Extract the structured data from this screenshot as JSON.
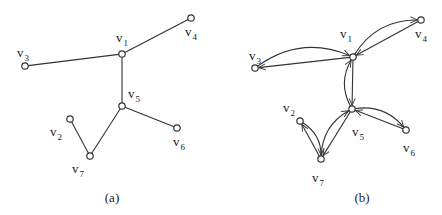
{
  "figure": {
    "panels": [
      {
        "id": "a",
        "caption": "(a)",
        "caption_pos": [
          112,
          202
        ],
        "type": "undirected-tree",
        "nodes": [
          {
            "id": "v1",
            "label": "v",
            "sub": "1",
            "pos": [
              122,
              54
            ],
            "label_pos": [
              116,
              42
            ]
          },
          {
            "id": "v2",
            "label": "v",
            "sub": "2",
            "pos": [
              70,
              119
            ],
            "label_pos": [
              50,
              136
            ]
          },
          {
            "id": "v3",
            "label": "v",
            "sub": "3",
            "pos": [
              25,
              66
            ],
            "label_pos": [
              17,
              57
            ]
          },
          {
            "id": "v4",
            "label": "v",
            "sub": "4",
            "pos": [
              191,
              18
            ],
            "label_pos": [
              185,
              36
            ]
          },
          {
            "id": "v5",
            "label": "v",
            "sub": "5",
            "pos": [
              122,
              106
            ],
            "label_pos": [
              128,
              98
            ]
          },
          {
            "id": "v6",
            "label": "v",
            "sub": "6",
            "pos": [
              177,
              128
            ],
            "label_pos": [
              173,
              146
            ]
          },
          {
            "id": "v7",
            "label": "v",
            "sub": "7",
            "pos": [
              90,
              156
            ],
            "label_pos": [
              72,
              173
            ]
          }
        ],
        "edges": [
          [
            "v3",
            "v1"
          ],
          [
            "v1",
            "v4"
          ],
          [
            "v1",
            "v5"
          ],
          [
            "v5",
            "v6"
          ],
          [
            "v5",
            "v7"
          ],
          [
            "v7",
            "v2"
          ]
        ]
      },
      {
        "id": "b",
        "caption": "(b)",
        "caption_pos": [
          362,
          202
        ],
        "type": "directed-symmetric",
        "nodes": [
          {
            "id": "v1",
            "label": "v",
            "sub": "1",
            "pos": [
              353,
              57
            ],
            "label_pos": [
              340,
              38
            ]
          },
          {
            "id": "v2",
            "label": "v",
            "sub": "2",
            "pos": [
              300,
              121
            ],
            "label_pos": [
              283,
              112
            ]
          },
          {
            "id": "v3",
            "label": "v",
            "sub": "3",
            "pos": [
              255,
              68
            ],
            "label_pos": [
              249,
              60
            ]
          },
          {
            "id": "v4",
            "label": "v",
            "sub": "4",
            "pos": [
              421,
              20
            ],
            "label_pos": [
              415,
              38
            ]
          },
          {
            "id": "v5",
            "label": "v",
            "sub": "5",
            "pos": [
              352,
              109
            ],
            "label_pos": [
              352,
              136
            ]
          },
          {
            "id": "v6",
            "label": "v",
            "sub": "6",
            "pos": [
              406,
              130
            ],
            "label_pos": [
              403,
              152
            ]
          },
          {
            "id": "v7",
            "label": "v",
            "sub": "7",
            "pos": [
              321,
              159
            ],
            "label_pos": [
              312,
              182
            ]
          }
        ],
        "arcs": [
          {
            "from": "v1",
            "to": "v3",
            "shape": "straight"
          },
          {
            "from": "v3",
            "to": "v1",
            "shape": "curved"
          },
          {
            "from": "v4",
            "to": "v1",
            "shape": "straight"
          },
          {
            "from": "v1",
            "to": "v4",
            "shape": "curved"
          },
          {
            "from": "v1",
            "to": "v5",
            "shape": "straight"
          },
          {
            "from": "v5",
            "to": "v1",
            "shape": "curved"
          },
          {
            "from": "v6",
            "to": "v5",
            "shape": "straight"
          },
          {
            "from": "v5",
            "to": "v6",
            "shape": "curved"
          },
          {
            "from": "v5",
            "to": "v7",
            "shape": "straight"
          },
          {
            "from": "v7",
            "to": "v5",
            "shape": "curved"
          },
          {
            "from": "v7",
            "to": "v2",
            "shape": "straight"
          },
          {
            "from": "v2",
            "to": "v7",
            "shape": "curved"
          }
        ]
      }
    ]
  }
}
